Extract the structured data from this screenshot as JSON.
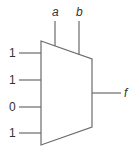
{
  "diagram": {
    "type": "4-to-1 multiplexer",
    "select_inputs": [
      {
        "label": "a"
      },
      {
        "label": "b"
      }
    ],
    "data_inputs": [
      {
        "label": "1"
      },
      {
        "label": "1"
      },
      {
        "label": "0"
      },
      {
        "label": "1"
      }
    ],
    "output": {
      "label": "f"
    },
    "colors": {
      "line": "#6b6b6b",
      "text": "#333333",
      "background": "#ffffff"
    }
  }
}
